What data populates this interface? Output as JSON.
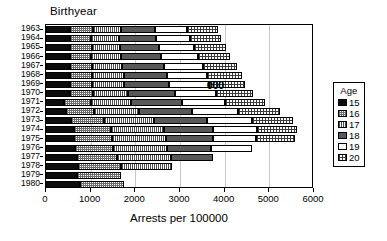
{
  "chart_data": {
    "type": "bar",
    "orientation": "horizontal",
    "stacked": true,
    "title": "Birthyear",
    "xlabel": "Arrests per 100000",
    "ylabel": "Birthyear",
    "xlim": [
      0,
      6000
    ],
    "xticks": [
      0,
      1000,
      2000,
      3000,
      4000,
      5000,
      6000
    ],
    "grid": true,
    "legend": {
      "title": "Age",
      "position": "right",
      "entries": [
        {
          "label": "15",
          "pattern": "solid-black",
          "color": "#0d0d0d"
        },
        {
          "label": "16",
          "pattern": "checkerboard",
          "color": "#6b6b6b"
        },
        {
          "label": "17",
          "pattern": "vertical-lines",
          "color": "#4d4d4d"
        },
        {
          "label": "18",
          "pattern": "solid-dark-gray",
          "color": "#595959"
        },
        {
          "label": "19",
          "pattern": "white",
          "color": "#ffffff"
        },
        {
          "label": "20",
          "pattern": "crosshatch-grid",
          "color": "#3d3d3d"
        }
      ]
    },
    "categories": [
      "1963",
      "1964",
      "1965",
      "1966",
      "1967",
      "1968",
      "1969",
      "1970",
      "1971",
      "1972",
      "1973",
      "1974",
      "1975",
      "1976",
      "1977",
      "1978",
      "1979",
      "1980"
    ],
    "series": [
      {
        "name": "15",
        "values": [
          530,
          530,
          530,
          530,
          530,
          530,
          530,
          530,
          400,
          450,
          560,
          620,
          620,
          640,
          690,
          720,
          690,
          760
        ]
      },
      {
        "name": "16",
        "values": [
          530,
          480,
          490,
          480,
          500,
          500,
          490,
          520,
          600,
          620,
          740,
          830,
          850,
          870,
          900,
          950,
          1000,
          980
        ]
      },
      {
        "name": "17",
        "values": [
          620,
          630,
          640,
          660,
          680,
          720,
          730,
          780,
          900,
          1020,
          1120,
          1200,
          1220,
          1200,
          1200,
          1160,
          0,
          0
        ]
      },
      {
        "name": "18",
        "values": [
          760,
          820,
          860,
          900,
          940,
          970,
          1010,
          1050,
          1140,
          1170,
          1180,
          1080,
          1040,
          980,
          940,
          0,
          0,
          0
        ]
      },
      {
        "name": "19",
        "values": [
          720,
          760,
          800,
          830,
          860,
          880,
          900,
          920,
          970,
          1030,
          1010,
          1000,
          980,
          920,
          0,
          0,
          0,
          0
        ]
      },
      {
        "name": "20",
        "values": [
          680,
          700,
          710,
          730,
          760,
          780,
          790,
          830,
          890,
          950,
          930,
          900,
          860,
          0,
          0,
          0,
          0,
          0
        ]
      }
    ],
    "totals": [
      3840,
      3920,
      4030,
      4130,
      4270,
      4380,
      4450,
      4630,
      4900,
      5240,
      5540,
      5630,
      5570,
      4610,
      3730,
      2830,
      1690,
      1740
    ],
    "annotations": [
      {
        "text": "000",
        "x_value": 3600,
        "category": "1969"
      }
    ]
  }
}
